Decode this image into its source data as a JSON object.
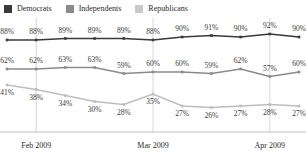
{
  "chart_data": {
    "type": "line",
    "title": "",
    "subtitle": "",
    "xlabel": "",
    "ylabel": "",
    "grid": true,
    "legend_position": "top-left",
    "x": [
      0,
      1,
      2,
      3,
      4,
      5,
      6,
      7,
      8,
      9,
      10
    ],
    "categories": [
      "",
      "Feb 2009",
      "",
      "",
      "",
      "Mar 2009",
      "",
      "",
      "",
      "Apr 2009",
      ""
    ],
    "tick_labels": [
      "Feb 2009",
      "Mar 2009",
      "Apr 2009"
    ],
    "value_suffix": "%",
    "ylim": [
      20,
      95
    ],
    "series": [
      {
        "name": "Democrats",
        "color": "#3a3a3a",
        "values": [
          88,
          88,
          89,
          89,
          89,
          88,
          90,
          91,
          90,
          92,
          90
        ],
        "labels": [
          "88%",
          "88%",
          "89%",
          "89%",
          "89%",
          "88%",
          "90%",
          "91%",
          "90%",
          "92%",
          "90%"
        ]
      },
      {
        "name": "Independents",
        "color": "#8a8a8a",
        "values": [
          62,
          62,
          63,
          63,
          59,
          60,
          60,
          59,
          62,
          57,
          60
        ],
        "labels": [
          "62%",
          "62%",
          "63%",
          "63%",
          "59%",
          "60%",
          "60%",
          "59%",
          "62%",
          "57%",
          "60%"
        ]
      },
      {
        "name": "Republicans",
        "color": "#bdbdbd",
        "values": [
          41,
          38,
          34,
          30,
          28,
          35,
          27,
          26,
          27,
          28,
          27
        ],
        "labels": [
          "41%",
          "38%",
          "34%",
          "30%",
          "28%",
          "35%",
          "27%",
          "26%",
          "27%",
          "28%",
          "27%"
        ]
      }
    ]
  },
  "legend": {
    "items": [
      {
        "label": "Democrats",
        "color": "#3a3a3a"
      },
      {
        "label": "Independents",
        "color": "#8a8a8a"
      },
      {
        "label": "Republicans",
        "color": "#c9c9c9"
      }
    ]
  },
  "axis": {
    "ticks": [
      {
        "label": "Feb 2009",
        "index": 1
      },
      {
        "label": "Mar 2009",
        "index": 5
      },
      {
        "label": "Apr 2009",
        "index": 9
      }
    ]
  },
  "colors": {
    "democrats": "#3a3a3a",
    "independents": "#8a8a8a",
    "republicans": "#bdbdbd",
    "gridline": "#d6d6d6",
    "axis": "#bfbfbf",
    "text": "#2b2b2b"
  }
}
